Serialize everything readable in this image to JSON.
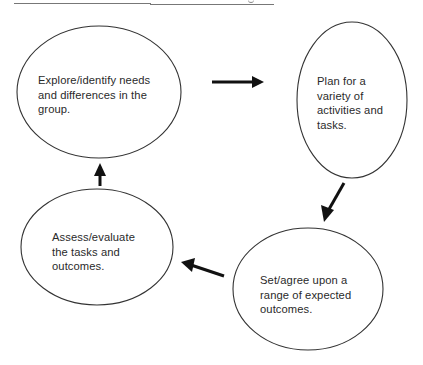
{
  "diagram": {
    "type": "cycle",
    "nodes": [
      {
        "id": "explore",
        "label": "Explore/identify needs\nand differences in the\ngroup."
      },
      {
        "id": "plan",
        "label": "Plan for a\nvariety of\nactivities and\ntasks."
      },
      {
        "id": "set",
        "label": "Set/agree upon a\nrange of expected\noutcomes."
      },
      {
        "id": "assess",
        "label": "Assess/evaluate\nthe tasks and\noutcomes."
      }
    ],
    "edges": [
      {
        "from": "explore",
        "to": "plan"
      },
      {
        "from": "plan",
        "to": "set"
      },
      {
        "from": "set",
        "to": "assess"
      },
      {
        "from": "assess",
        "to": "explore"
      }
    ],
    "colors": {
      "stroke": "#333333",
      "arrow": "#111111",
      "text": "#2a2a2a"
    }
  }
}
